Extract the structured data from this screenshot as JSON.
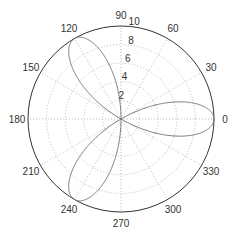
{
  "chart_data": {
    "type": "line",
    "subtype": "polar",
    "title": "",
    "function": "r = 10*cos(3*theta)",
    "series": [
      {
        "name": "rose",
        "color": "#777777",
        "petals": 3,
        "max_r": 10,
        "petal_angles_deg": [
          0,
          120,
          240
        ]
      }
    ],
    "radial_ticks": [
      2,
      4,
      6,
      8,
      10
    ],
    "rlim": [
      0,
      10
    ],
    "angle_ticks_deg": [
      0,
      30,
      60,
      90,
      120,
      150,
      180,
      210,
      240,
      270,
      300,
      330
    ],
    "angle_tick_labels": [
      "0",
      "30",
      "60",
      "90",
      "120",
      "150",
      "180",
      "210",
      "240",
      "270",
      "300",
      "330"
    ],
    "grid": true,
    "grid_style": "dotted"
  },
  "layout": {
    "cx": 121,
    "cy": 119,
    "R": 93,
    "grid_color": "#aaaaaa",
    "axis_color": "#333333"
  }
}
